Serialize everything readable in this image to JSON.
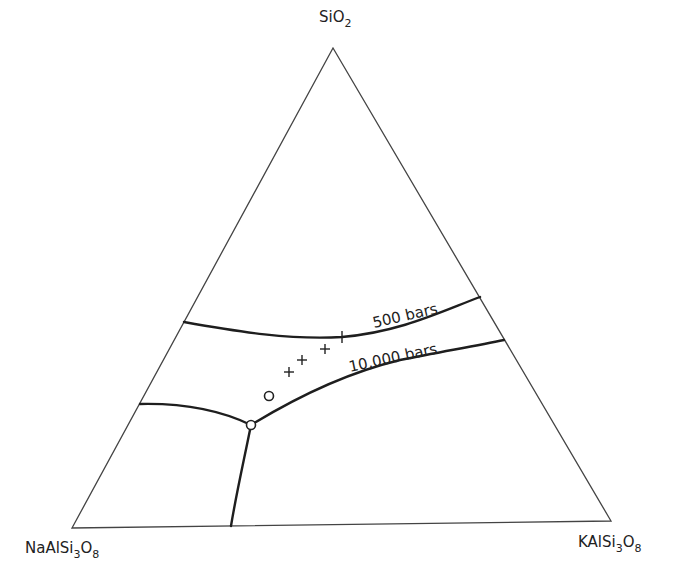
{
  "diagram": {
    "type": "ternary-phase-diagram",
    "vertices": {
      "top": {
        "formula": "SiO",
        "subscript": "2"
      },
      "bottom_left": {
        "formula_parts": [
          "NaAlSi",
          "3",
          "O",
          "8"
        ]
      },
      "bottom_right": {
        "formula_parts": [
          "KAlSi",
          "3",
          "O",
          "8"
        ]
      }
    },
    "curves": [
      {
        "name": "500-bars-boundary",
        "label": "500 bars"
      },
      {
        "name": "10000-bars-boundary",
        "label": "10,000 bars"
      }
    ],
    "points": {
      "crosses": 4,
      "open_circles": 1,
      "junction_circle": 1
    },
    "colors": {
      "line": "#1e1e1e",
      "background": "#ffffff"
    }
  }
}
